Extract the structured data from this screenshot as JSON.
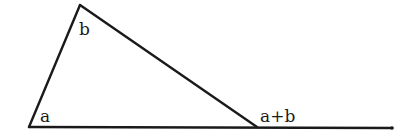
{
  "diagram": {
    "type": "geometry",
    "colors": {
      "stroke": "#1a1a1a",
      "background": "#ffffff"
    },
    "vertices": {
      "top": [
        80,
        5
      ],
      "bottom_left": [
        29,
        127
      ],
      "bottom_right": [
        257,
        127
      ],
      "baseline_end": [
        392,
        128
      ]
    },
    "labels": {
      "angle_a": "a",
      "angle_b": "b",
      "exterior_angle": "a+b"
    }
  }
}
